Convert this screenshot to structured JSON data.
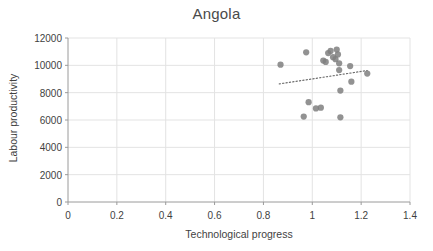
{
  "chart_data": {
    "type": "scatter",
    "title": "Angola",
    "xlabel": "Technological progress",
    "ylabel": "Labour productivity",
    "xlim": [
      0,
      1.4
    ],
    "ylim": [
      0,
      12000
    ],
    "xticks": [
      "0",
      "0.2",
      "0.4",
      "0.6",
      "0.8",
      "1",
      "1.2",
      "1.4"
    ],
    "xtick_values": [
      0,
      0.2,
      0.4,
      0.6,
      0.8,
      1,
      1.2,
      1.4
    ],
    "yticks": [
      "0",
      "2000",
      "4000",
      "6000",
      "8000",
      "10000",
      "12000"
    ],
    "ytick_values": [
      0,
      2000,
      4000,
      6000,
      8000,
      10000,
      12000
    ],
    "grid": true,
    "grid_color": "#e3e3e3",
    "axis_color": "#9a9a9a",
    "legend": null,
    "marker_color": "#7f7f7f",
    "marker_size": 5.0,
    "points": [
      {
        "x": 0.87,
        "y": 10050
      },
      {
        "x": 0.975,
        "y": 10950
      },
      {
        "x": 0.965,
        "y": 6250
      },
      {
        "x": 0.985,
        "y": 7300
      },
      {
        "x": 1.015,
        "y": 6850
      },
      {
        "x": 1.035,
        "y": 6900
      },
      {
        "x": 1.045,
        "y": 10350
      },
      {
        "x": 1.055,
        "y": 10250
      },
      {
        "x": 1.065,
        "y": 10900
      },
      {
        "x": 1.075,
        "y": 11050
      },
      {
        "x": 1.085,
        "y": 10600
      },
      {
        "x": 1.095,
        "y": 10450
      },
      {
        "x": 1.1,
        "y": 11150
      },
      {
        "x": 1.105,
        "y": 10800
      },
      {
        "x": 1.11,
        "y": 10150
      },
      {
        "x": 1.11,
        "y": 9650
      },
      {
        "x": 1.115,
        "y": 8150
      },
      {
        "x": 1.115,
        "y": 6200
      },
      {
        "x": 1.155,
        "y": 9950
      },
      {
        "x": 1.16,
        "y": 8800
      },
      {
        "x": 1.225,
        "y": 9400
      }
    ],
    "trendline": {
      "style": "dotted",
      "color": "#6f6f6f",
      "x_start": 0.865,
      "y_start": 8640,
      "x_end": 1.225,
      "y_end": 9620
    }
  }
}
